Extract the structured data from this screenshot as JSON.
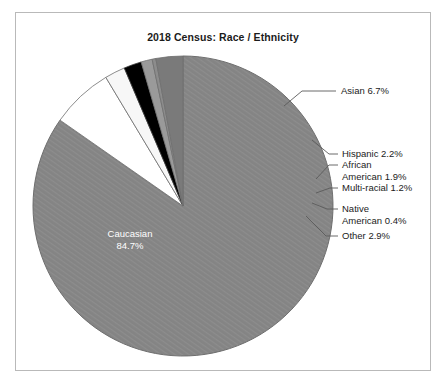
{
  "frame": {
    "border_color": "#b9b9b9",
    "background": "#ffffff"
  },
  "chart_data": {
    "type": "pie",
    "title": "2018 Census: Race / Ethnicity",
    "xlabel": "",
    "ylabel": "",
    "legend_position": "none",
    "labels_position": "callout",
    "categories": [
      "Caucasian",
      "Asian",
      "Hispanic",
      "African American",
      "Multi-racial",
      "Native American",
      "Other"
    ],
    "values": [
      84.7,
      6.7,
      2.2,
      1.9,
      1.2,
      0.4,
      2.9
    ],
    "unit": "%",
    "colors": [
      "#848484",
      "#ffffff",
      "#f7f7f7",
      "#000000",
      "#9a9a9a",
      "#8c8c8c",
      "#7a7a7a"
    ],
    "slice_label_texts": [
      "Caucasian 84.7%",
      "Asian 6.7%",
      "Hispanic 2.2%",
      "African American 1.9%",
      "Multi-racial 1.2%",
      "Native American 0.4%",
      "Other 2.9%"
    ]
  },
  "pie": {
    "center_x": 167,
    "center_y": 193,
    "radius": 150,
    "start_angle_deg": -90,
    "stroke": "#5a5a5a",
    "inner_label": {
      "line1": "Caucasian",
      "line2": "84.7%",
      "color": "#ffffff"
    }
  },
  "callouts": [
    {
      "id": "asian",
      "line1": "Asian 6.7%",
      "line2": ""
    },
    {
      "id": "hispanic",
      "line1": "Hispanic 2.2%",
      "line2": ""
    },
    {
      "id": "african-american",
      "line1": "African",
      "line2": "American 1.9%"
    },
    {
      "id": "multi-racial",
      "line1": "Multi-racial 1.2%",
      "line2": ""
    },
    {
      "id": "native-american",
      "line1": "Native",
      "line2": "American 0.4%"
    },
    {
      "id": "other",
      "line1": "Other 2.9%",
      "line2": ""
    }
  ]
}
